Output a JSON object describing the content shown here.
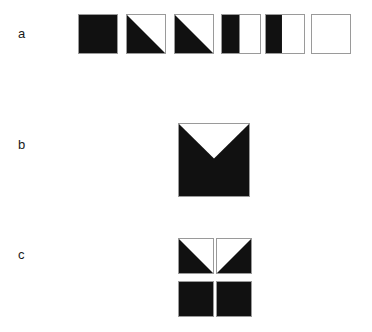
{
  "figure": {
    "name": "black-white-square-shading-figure",
    "background_color": "#ffffff",
    "fill_color": "#111111",
    "outline_color": "#9a9a9a",
    "width": 372,
    "height": 332
  },
  "rows": [
    {
      "label": "a",
      "name": "row-a-gradient-series",
      "description": "Six outlined squares in a horizontal series, shading from fully black to fully white",
      "cells": [
        {
          "name": "square-a1",
          "fill_pattern": "full-black",
          "black_fraction": 1.0,
          "label": "100% black"
        },
        {
          "name": "square-a2",
          "fill_pattern": "diagonal-lower-left",
          "black_fraction": 0.5,
          "label": "lower-left triangle black"
        },
        {
          "name": "square-a3",
          "fill_pattern": "diagonal-lower-left",
          "black_fraction": 0.5,
          "label": "lower-left triangle black"
        },
        {
          "name": "square-a4",
          "fill_pattern": "vertical-left-half",
          "black_fraction": 0.46,
          "label": "left vertical band black"
        },
        {
          "name": "square-a5",
          "fill_pattern": "vertical-left-half",
          "black_fraction": 0.42,
          "label": "left vertical band black"
        },
        {
          "name": "square-a6",
          "fill_pattern": "full-white",
          "black_fraction": 0.0,
          "label": "100% white"
        }
      ]
    },
    {
      "label": "b",
      "name": "row-b-single-large-square",
      "description": "One large black square with a white inverted triangular notch cut from the top edge, apex pointing down",
      "cells": [
        {
          "name": "square-b1",
          "fill_pattern": "black-with-top-v-notch",
          "black_fraction": 0.78,
          "label": "black square with white V notch at top"
        }
      ]
    },
    {
      "label": "c",
      "name": "row-c-two-by-two-grid",
      "description": "Four smaller squares arranged 2x2; the top pair's diagonals combine to form the same V notch as row b",
      "cells": [
        {
          "name": "square-c-top-left",
          "fill_pattern": "diagonal-lower-left",
          "black_fraction": 0.5,
          "label": "lower-left triangle black"
        },
        {
          "name": "square-c-top-right",
          "fill_pattern": "diagonal-lower-right",
          "black_fraction": 0.5,
          "label": "lower-right triangle black"
        },
        {
          "name": "square-c-bottom-left",
          "fill_pattern": "full-black",
          "black_fraction": 1.0,
          "label": "100% black"
        },
        {
          "name": "square-c-bottom-right",
          "fill_pattern": "full-black",
          "black_fraction": 1.0,
          "label": "100% black"
        }
      ]
    }
  ]
}
